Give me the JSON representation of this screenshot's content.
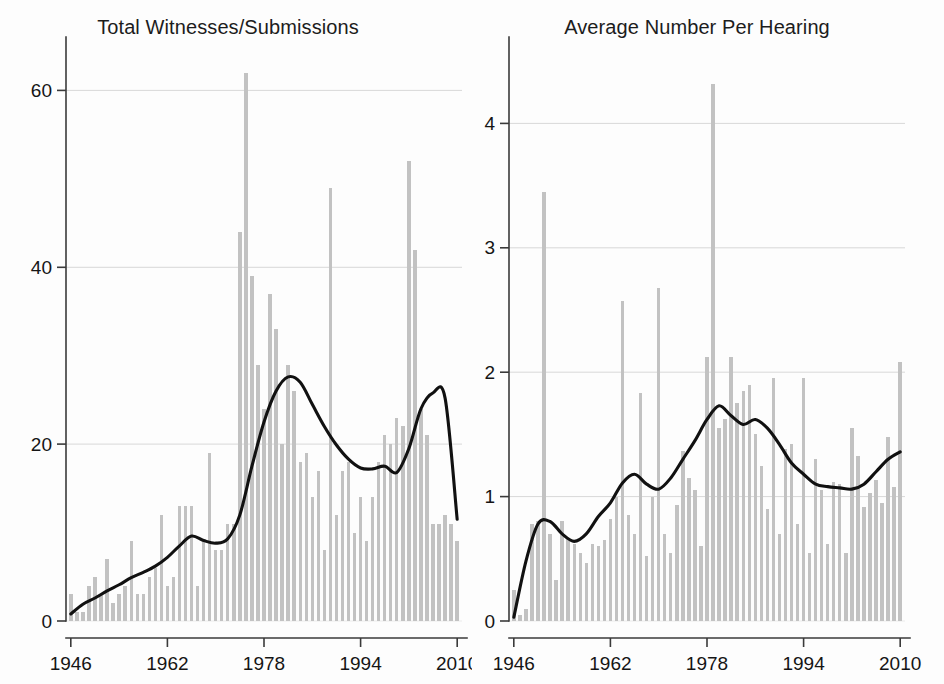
{
  "figure": {
    "background_color": "#fdfdfd",
    "bar_color": "#c2c2c2",
    "line_color": "#111111",
    "grid_color": "#d8d8d8",
    "axis_color": "#3a3a3a"
  },
  "chart_data": [
    {
      "type": "bar",
      "panel": "left",
      "title": "Total Witnesses/Submissions",
      "xlabel": "",
      "ylabel": "",
      "xlim": [
        1945.2,
        2010.8
      ],
      "ylim": [
        0,
        64
      ],
      "xticks": [
        1946,
        1962,
        1978,
        1994,
        2010
      ],
      "xtick_labels": [
        "1946",
        "1962",
        "1978",
        "1994",
        "2010"
      ],
      "yticks": [
        0,
        20,
        40,
        60
      ],
      "ytick_labels": [
        "0",
        "20",
        "40",
        "60"
      ],
      "grid": "horizontal",
      "legend": "none",
      "x": [
        1946,
        1947,
        1948,
        1949,
        1950,
        1951,
        1952,
        1953,
        1954,
        1955,
        1956,
        1957,
        1958,
        1959,
        1960,
        1961,
        1962,
        1963,
        1964,
        1965,
        1966,
        1967,
        1968,
        1969,
        1970,
        1971,
        1972,
        1973,
        1974,
        1975,
        1976,
        1977,
        1978,
        1979,
        1980,
        1981,
        1982,
        1983,
        1984,
        1985,
        1986,
        1987,
        1988,
        1989,
        1990,
        1991,
        1992,
        1993,
        1994,
        1995,
        1996,
        1997,
        1998,
        1999,
        2000,
        2001,
        2002,
        2003,
        2004,
        2005,
        2006,
        2007,
        2008,
        2009,
        2010
      ],
      "values": [
        3,
        1,
        1,
        4,
        5,
        3,
        7,
        2,
        3,
        4,
        9,
        3,
        3,
        5,
        6,
        12,
        4,
        5,
        13,
        13,
        13,
        4,
        9,
        19,
        8,
        8,
        11,
        11,
        44,
        62,
        39,
        29,
        24,
        37,
        33,
        20,
        29,
        26,
        18,
        19,
        14,
        17,
        8,
        49,
        12,
        17,
        18,
        10,
        14,
        9,
        14,
        18,
        21,
        20,
        23,
        22,
        52,
        42,
        24,
        21,
        11,
        11,
        12,
        11,
        9
      ],
      "series": [
        {
          "name": "bars",
          "kind": "bar",
          "values": [
            3,
            1,
            1,
            4,
            5,
            3,
            7,
            2,
            3,
            4,
            9,
            3,
            3,
            5,
            6,
            12,
            4,
            5,
            13,
            13,
            13,
            4,
            9,
            19,
            8,
            8,
            11,
            11,
            44,
            62,
            39,
            29,
            24,
            37,
            33,
            20,
            29,
            26,
            18,
            19,
            14,
            17,
            8,
            49,
            12,
            17,
            18,
            10,
            14,
            9,
            14,
            18,
            21,
            20,
            23,
            22,
            52,
            42,
            24,
            21,
            11,
            11,
            12,
            11,
            9
          ]
        },
        {
          "name": "smoothed trend",
          "kind": "line",
          "x": [
            1946,
            1948,
            1950,
            1952,
            1954,
            1956,
            1958,
            1960,
            1962,
            1964,
            1966,
            1968,
            1970,
            1972,
            1974,
            1976,
            1978,
            1980,
            1982,
            1984,
            1986,
            1988,
            1990,
            1992,
            1994,
            1996,
            1998,
            2000,
            2002,
            2004,
            2006,
            2008,
            2010
          ],
          "values": [
            0.8,
            1.9,
            2.6,
            3.4,
            4.1,
            4.9,
            5.5,
            6.2,
            7.2,
            8.5,
            9.6,
            9.1,
            8.8,
            9.3,
            12.0,
            17.5,
            22.5,
            26.0,
            27.6,
            27.0,
            24.5,
            22.0,
            19.9,
            18.3,
            17.3,
            17.2,
            17.5,
            16.8,
            19.5,
            24.0,
            25.8,
            25.2,
            11.5
          ]
        }
      ]
    },
    {
      "type": "bar",
      "panel": "right",
      "title": "Average Number Per Hearing",
      "xlabel": "",
      "ylabel": "",
      "xlim": [
        1945.2,
        2010.8
      ],
      "ylim": [
        0,
        4.55
      ],
      "xticks": [
        1946,
        1962,
        1978,
        1994,
        2010
      ],
      "xtick_labels": [
        "1946",
        "1962",
        "1978",
        "1994",
        "2010"
      ],
      "yticks": [
        0,
        1,
        2,
        3,
        4
      ],
      "ytick_labels": [
        "0",
        "1",
        "2",
        "3",
        "4"
      ],
      "grid": "horizontal",
      "legend": "none",
      "x": [
        1946,
        1947,
        1948,
        1949,
        1950,
        1951,
        1952,
        1953,
        1954,
        1955,
        1956,
        1957,
        1958,
        1959,
        1960,
        1961,
        1962,
        1963,
        1964,
        1965,
        1966,
        1967,
        1968,
        1969,
        1970,
        1971,
        1972,
        1973,
        1974,
        1975,
        1976,
        1977,
        1978,
        1979,
        1980,
        1981,
        1982,
        1983,
        1984,
        1985,
        1986,
        1987,
        1988,
        1989,
        1990,
        1991,
        1992,
        1993,
        1994,
        1995,
        1996,
        1997,
        1998,
        1999,
        2000,
        2001,
        2002,
        2003,
        2004,
        2005,
        2006,
        2007,
        2008,
        2009,
        2010
      ],
      "values": [
        0.25,
        0.05,
        0.1,
        0.78,
        0.8,
        3.45,
        0.7,
        0.33,
        0.8,
        0.67,
        0.62,
        0.55,
        0.47,
        0.62,
        0.6,
        0.65,
        0.82,
        1.0,
        2.57,
        0.85,
        0.7,
        1.83,
        0.52,
        1.0,
        2.68,
        0.7,
        0.55,
        0.93,
        1.37,
        1.15,
        1.05,
        0.6,
        2.12,
        4.32,
        1.55,
        1.62,
        2.12,
        1.75,
        1.85,
        1.9,
        1.5,
        1.25,
        0.9,
        1.95,
        0.7,
        1.38,
        1.42,
        0.78,
        1.95,
        0.55,
        1.3,
        1.05,
        0.62,
        1.12,
        1.1,
        0.55,
        1.55,
        1.33,
        0.92,
        1.03,
        1.13,
        0.95,
        1.48,
        1.08,
        2.08
      ],
      "series": [
        {
          "name": "bars",
          "kind": "bar",
          "values": [
            0.25,
            0.05,
            0.1,
            0.78,
            0.8,
            3.45,
            0.7,
            0.33,
            0.8,
            0.67,
            0.62,
            0.55,
            0.47,
            0.62,
            0.6,
            0.65,
            0.82,
            1.0,
            2.57,
            0.85,
            0.7,
            1.83,
            0.52,
            1.0,
            2.68,
            0.7,
            0.55,
            0.93,
            1.37,
            1.15,
            1.05,
            0.6,
            2.12,
            4.32,
            1.55,
            1.62,
            2.12,
            1.75,
            1.85,
            1.9,
            1.5,
            1.25,
            0.9,
            1.95,
            0.7,
            1.38,
            1.42,
            0.78,
            1.95,
            0.55,
            1.3,
            1.05,
            0.62,
            1.12,
            1.1,
            0.55,
            1.55,
            1.33,
            0.92,
            1.03,
            1.13,
            0.95,
            1.48,
            1.08,
            2.08
          ]
        },
        {
          "name": "smoothed trend",
          "kind": "line",
          "x": [
            1946,
            1948,
            1950,
            1952,
            1954,
            1956,
            1958,
            1960,
            1962,
            1964,
            1966,
            1968,
            1970,
            1972,
            1974,
            1976,
            1978,
            1980,
            1982,
            1984,
            1986,
            1988,
            1990,
            1992,
            1994,
            1996,
            1998,
            2000,
            2002,
            2004,
            2006,
            2008,
            2010
          ],
          "values": [
            0.03,
            0.48,
            0.78,
            0.8,
            0.7,
            0.64,
            0.7,
            0.84,
            0.95,
            1.11,
            1.18,
            1.1,
            1.06,
            1.15,
            1.3,
            1.45,
            1.62,
            1.73,
            1.65,
            1.58,
            1.62,
            1.55,
            1.42,
            1.27,
            1.18,
            1.1,
            1.08,
            1.07,
            1.06,
            1.1,
            1.2,
            1.3,
            1.36
          ]
        }
      ]
    }
  ]
}
